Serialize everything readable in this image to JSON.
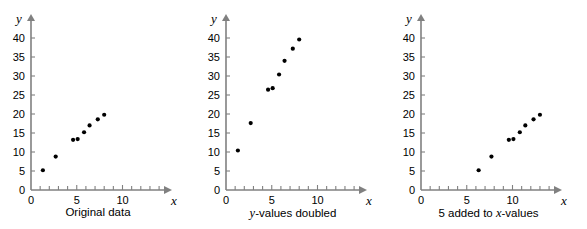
{
  "figure": {
    "title": "",
    "panel_count": 3
  },
  "chart_data": [
    {
      "type": "scatter",
      "title": "Original data",
      "xlabel": "x",
      "ylabel": "y",
      "xlim": [
        0,
        13.5
      ],
      "ylim": [
        0,
        42
      ],
      "xticks": [
        0,
        5,
        10
      ],
      "yticks": [
        0,
        5,
        10,
        15,
        20,
        25,
        30,
        35,
        40
      ],
      "xtick_labels": [
        "0",
        "5",
        "10"
      ],
      "ytick_labels": [
        "0",
        "5",
        "10",
        "15",
        "20",
        "25",
        "30",
        "35",
        "40"
      ],
      "minor_x_step": 1,
      "grid": false,
      "legend": "none",
      "points": [
        {
          "x": 1.3,
          "y": 5.2
        },
        {
          "x": 2.7,
          "y": 8.8
        },
        {
          "x": 4.6,
          "y": 13.2
        },
        {
          "x": 5.1,
          "y": 13.4
        },
        {
          "x": 5.8,
          "y": 15.2
        },
        {
          "x": 6.4,
          "y": 17.0
        },
        {
          "x": 7.3,
          "y": 18.6
        },
        {
          "x": 8.0,
          "y": 19.8
        }
      ]
    },
    {
      "type": "scatter",
      "title": "y-values doubled",
      "title_italic_prefix": "y",
      "title_rest": "-values doubled",
      "xlabel": "x",
      "ylabel": "y",
      "xlim": [
        0,
        13.5
      ],
      "ylim": [
        0,
        42
      ],
      "xticks": [
        0,
        5,
        10
      ],
      "yticks": [
        0,
        5,
        10,
        15,
        20,
        25,
        30,
        35,
        40
      ],
      "xtick_labels": [
        "0",
        "5",
        "10"
      ],
      "ytick_labels": [
        "0",
        "5",
        "10",
        "15",
        "20",
        "25",
        "30",
        "35",
        "40"
      ],
      "minor_x_step": 1,
      "grid": false,
      "legend": "none",
      "points": [
        {
          "x": 1.3,
          "y": 10.4
        },
        {
          "x": 2.7,
          "y": 17.6
        },
        {
          "x": 4.6,
          "y": 26.4
        },
        {
          "x": 5.1,
          "y": 26.8
        },
        {
          "x": 5.8,
          "y": 30.4
        },
        {
          "x": 6.4,
          "y": 34.0
        },
        {
          "x": 7.3,
          "y": 37.2
        },
        {
          "x": 8.0,
          "y": 39.6
        }
      ]
    },
    {
      "type": "scatter",
      "title": "5 added to x-values",
      "title_prefix": "5 added to ",
      "title_italic": "x",
      "title_suffix": "-values",
      "xlabel": "x",
      "ylabel": "y",
      "xlim": [
        0,
        13.5
      ],
      "ylim": [
        0,
        42
      ],
      "xticks": [
        0,
        5,
        10
      ],
      "yticks": [
        0,
        5,
        10,
        15,
        20,
        25,
        30,
        35,
        40
      ],
      "xtick_labels": [
        "0",
        "5",
        "10"
      ],
      "ytick_labels": [
        "0",
        "5",
        "10",
        "15",
        "20",
        "25",
        "30",
        "35",
        "40"
      ],
      "minor_x_step": 1,
      "grid": false,
      "legend": "none",
      "points": [
        {
          "x": 6.3,
          "y": 5.2
        },
        {
          "x": 7.7,
          "y": 8.8
        },
        {
          "x": 9.6,
          "y": 13.2
        },
        {
          "x": 10.1,
          "y": 13.4
        },
        {
          "x": 10.8,
          "y": 15.2
        },
        {
          "x": 11.4,
          "y": 17.0
        },
        {
          "x": 12.3,
          "y": 18.6
        },
        {
          "x": 13.0,
          "y": 19.8
        }
      ]
    }
  ],
  "captions": {
    "panel1": "Original data",
    "panel2_italic": "y",
    "panel2_rest": "-values doubled",
    "panel3_pre": "5 added to ",
    "panel3_italic": "x",
    "panel3_post": "-values"
  },
  "axis_labels": {
    "x": "x",
    "y": "y"
  },
  "colors": {
    "axis": "#808080",
    "marker": "#000000",
    "text": "#000000",
    "background": "#ffffff"
  }
}
